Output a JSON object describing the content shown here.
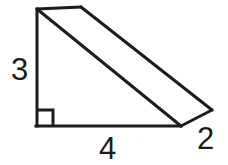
{
  "figure": {
    "kind": "geometry-diagram",
    "background_color": "#ffffff",
    "stroke_color": "#1c1c1c",
    "stroke_width": 3,
    "labels": {
      "height": "3",
      "base": "4",
      "depth": "2"
    },
    "marks": {
      "right_angle": "right-angle-square"
    },
    "vertices": {
      "front_top": [
        36,
        9
      ],
      "front_bottom_left": [
        36,
        126
      ],
      "front_bottom_right": [
        180,
        126
      ],
      "back_top": [
        81,
        7
      ],
      "back_bottom_right": [
        212,
        110
      ]
    }
  }
}
